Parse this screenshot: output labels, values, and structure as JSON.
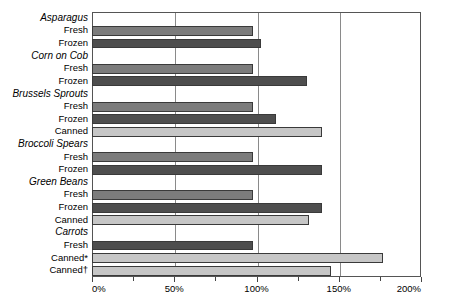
{
  "chart_data": {
    "type": "bar",
    "orientation": "horizontal",
    "title": "",
    "xlabel": "",
    "ylabel": "",
    "xlim": [
      0,
      200
    ],
    "xunit": "%",
    "grid": true,
    "legend": "none",
    "xticks": [
      {
        "value": 0,
        "label": "0%",
        "major": true
      },
      {
        "value": 25,
        "label": "",
        "major": false
      },
      {
        "value": 50,
        "label": "50%",
        "major": true
      },
      {
        "value": 75,
        "label": "",
        "major": false
      },
      {
        "value": 100,
        "label": "100%",
        "major": true
      },
      {
        "value": 125,
        "label": "",
        "major": false
      },
      {
        "value": 150,
        "label": "150%",
        "major": true
      },
      {
        "value": 175,
        "label": "",
        "major": false
      },
      {
        "value": 200,
        "label": "200%",
        "major": true
      }
    ],
    "gridlines": [
      50,
      100,
      150
    ],
    "colors": {
      "fresh": "#7c7c7c",
      "frozen": "#4e4e4e",
      "canned": "#c6c6c6",
      "border": "#3a3a3a",
      "background": "#ffffff"
    },
    "groups": [
      {
        "name": "Asparagus",
        "bars": [
          {
            "label": "Fresh",
            "value": 98,
            "shade": "mid"
          },
          {
            "label": "Frozen",
            "value": 103,
            "shade": "dark"
          }
        ]
      },
      {
        "name": "Corn on Cob",
        "bars": [
          {
            "label": "Fresh",
            "value": 98,
            "shade": "mid"
          },
          {
            "label": "Frozen",
            "value": 131,
            "shade": "dark"
          }
        ]
      },
      {
        "name": "Brussels Sprouts",
        "bars": [
          {
            "label": "Fresh",
            "value": 98,
            "shade": "mid"
          },
          {
            "label": "Frozen",
            "value": 112,
            "shade": "dark"
          },
          {
            "label": "Canned",
            "value": 140,
            "shade": "light"
          }
        ]
      },
      {
        "name": "Broccoli Spears",
        "bars": [
          {
            "label": "Fresh",
            "value": 98,
            "shade": "mid"
          },
          {
            "label": "Frozen",
            "value": 140,
            "shade": "dark"
          }
        ]
      },
      {
        "name": "Green Beans",
        "bars": [
          {
            "label": "Fresh",
            "value": 98,
            "shade": "mid"
          },
          {
            "label": "Frozen",
            "value": 140,
            "shade": "dark"
          },
          {
            "label": "Canned",
            "value": 132,
            "shade": "light"
          }
        ]
      },
      {
        "name": "Carrots",
        "bars": [
          {
            "label": "Fresh",
            "value": 98,
            "shade": "dark"
          },
          {
            "label": "Canned*",
            "value": 177,
            "shade": "light"
          },
          {
            "label": "Canned†",
            "value": 145,
            "shade": "light"
          }
        ]
      }
    ]
  }
}
